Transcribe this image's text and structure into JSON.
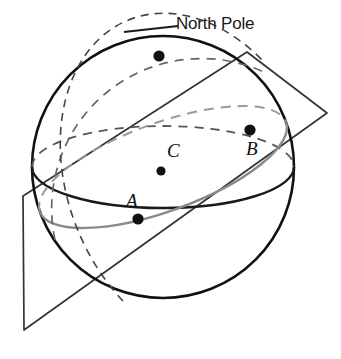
{
  "figure": {
    "background_color": "#ffffff"
  },
  "labels": {
    "north_pole": "North Pole",
    "point_a": "A",
    "point_b": "B",
    "point_c": "C"
  },
  "colors": {
    "outline": "#111111",
    "equator_front": "#1a1a1a",
    "equator_back_dashed": "#555555",
    "great_circle": "#8a8a8a",
    "great_circle_dashed": "#9a9a9a",
    "plane_edge": "#333333",
    "point_fill": "#111111"
  },
  "geometry": {
    "sphere": {
      "cx": 163,
      "cy": 167,
      "r": 131
    },
    "points": {
      "north_pole": {
        "x": 159,
        "y": 56,
        "r": 5.5
      },
      "a": {
        "x": 138,
        "y": 219,
        "r": 5.5
      },
      "b": {
        "x": 250,
        "y": 130,
        "r": 5.5
      },
      "c": {
        "x": 161,
        "y": 171,
        "r": 4.5
      }
    },
    "leader_line": {
      "x1": 124,
      "y1": 31,
      "x2": 176,
      "y2": 25
    },
    "plane_vertices": "23,196 247,52 327,113 24,330"
  }
}
